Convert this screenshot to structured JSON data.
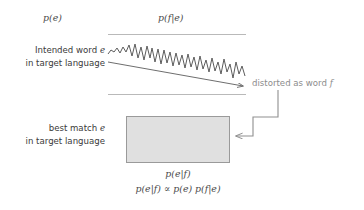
{
  "diagram": {
    "title_labels": {
      "prior": "p(e)",
      "channel": "p(f|e)"
    },
    "source_text": {
      "line1": "Intended word e",
      "line2": "in target language"
    },
    "result_text": {
      "line1": "best match  e",
      "line2": "in target language"
    },
    "distortion_label": "distorted as word f",
    "posterior_label": "p(e|f)",
    "bayes_rule": "p(e|f) ∝ p(e) p(f|e)",
    "bayes_rule_parts": {
      "left": "p(e|f)",
      "operator": "∝",
      "right": "p(e) p(f|e)"
    },
    "colors": {
      "rule_line": "#b9b9b9",
      "box_fill": "#e0e0e0",
      "box_border": "#9a9a9a",
      "waveform": "#5c5c5c",
      "arrow": "#6e6e6e",
      "text": "#3a3a3a",
      "muted_text": "#8c8c8c",
      "background": "#ffffff"
    },
    "shapes": {
      "waveform_name": "noisy-signal-waveform",
      "box_name": "best-match-block",
      "arrow_name": "distortion-arrow",
      "connector_name": "elbow-connector"
    }
  }
}
